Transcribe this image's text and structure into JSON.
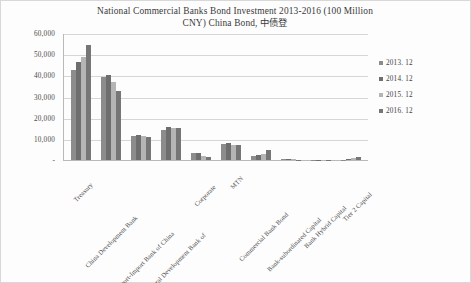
{
  "chart_data": {
    "type": "bar",
    "title": "National Commercial Banks Bond Investment 2013-2016 (100 Million CNY) China Bond, 中债登",
    "title_line1": "National Commercial Banks Bond Investment 2013-2016 (100 Million",
    "title_line2": "CNY) China Bond, 中债登",
    "xlabel": "",
    "ylabel": "",
    "ylim": [
      0,
      60000
    ],
    "grid": true,
    "legend_position": "right",
    "y_ticks": [
      "-",
      "10,000",
      "20,000",
      "30,000",
      "40,000",
      "50,000",
      "60,000"
    ],
    "y_tick_values": [
      0,
      10000,
      20000,
      30000,
      40000,
      50000,
      60000
    ],
    "categories": [
      "Treasury",
      "China Development Bank",
      "The Export-Import Bank of China",
      "Agricultural Development Bank of",
      "Corporate",
      "MTN",
      "Commercial Bank Bond",
      "Bank-subordinated Capital",
      "Bank Hybrid Capital",
      "Tier 2 Capital"
    ],
    "series": [
      {
        "name": "2013. 12",
        "color": "#8c8c8c",
        "values": [
          42500,
          39000,
          11500,
          14000,
          3500,
          7500,
          1800,
          700,
          200,
          200
        ]
      },
      {
        "name": "2014. 12",
        "color": "#6e6e6e",
        "values": [
          46500,
          40000,
          12000,
          15500,
          3500,
          8000,
          2500,
          500,
          200,
          400
        ]
      },
      {
        "name": "2015. 12",
        "color": "#b5b5b5",
        "values": [
          48500,
          37000,
          11500,
          15000,
          2000,
          7000,
          3000,
          300,
          150,
          900
        ]
      },
      {
        "name": "2016. 12",
        "color": "#767676",
        "values": [
          54500,
          32500,
          11000,
          15000,
          1500,
          7200,
          4500,
          200,
          150,
          1200
        ]
      }
    ]
  },
  "legend": {
    "items": [
      {
        "label": "2013. 12"
      },
      {
        "label": "2014. 12"
      },
      {
        "label": "2015. 12"
      },
      {
        "label": "2016. 12"
      }
    ]
  },
  "colors": {
    "plot_background": "#fdfdfd",
    "gridline": "#d6d6d6",
    "axis": "#b9b9b9",
    "text": "#4a4a4a"
  }
}
